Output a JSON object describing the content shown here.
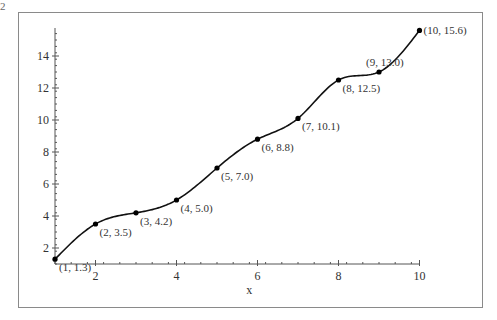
{
  "chart_data": {
    "type": "line",
    "title": "",
    "xlabel": "x",
    "ylabel": "",
    "xlim": [
      1,
      10
    ],
    "ylim": [
      1,
      15.75
    ],
    "x_ticks": [
      2,
      4,
      6,
      8,
      10
    ],
    "y_ticks": [
      2,
      4,
      6,
      8,
      10,
      12,
      14
    ],
    "grid": false,
    "legend": null,
    "series": [
      {
        "name": "interpolating curve",
        "points": [
          {
            "x": 1,
            "y": 1.3,
            "label": "(1, 1.3)"
          },
          {
            "x": 2,
            "y": 3.5,
            "label": "(2, 3.5)"
          },
          {
            "x": 3,
            "y": 4.2,
            "label": "(3, 4.2)"
          },
          {
            "x": 4,
            "y": 5.0,
            "label": "(4, 5.0)"
          },
          {
            "x": 5,
            "y": 7.0,
            "label": "(5, 7.0)"
          },
          {
            "x": 6,
            "y": 8.8,
            "label": "(6, 8.8)"
          },
          {
            "x": 7,
            "y": 10.1,
            "label": "(7, 10.1)"
          },
          {
            "x": 8,
            "y": 12.5,
            "label": "(8, 12.5)"
          },
          {
            "x": 9,
            "y": 13.0,
            "label": "(9, 13.0)"
          },
          {
            "x": 10,
            "y": 15.6,
            "label": "(10, 15.6)"
          }
        ]
      }
    ],
    "annotations": [
      "curve peaks near x≈8.6 (y≈13.6) and dips near x≈9.6 (y≈11.9) before rising to (10, 15.6)"
    ]
  },
  "corner_glyph": "2"
}
